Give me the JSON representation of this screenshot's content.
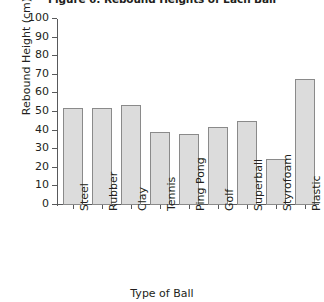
{
  "chart_data": {
    "type": "bar",
    "title": "Figure 6: Rebound Heights of Each Ball",
    "xlabel": "Type of Ball",
    "ylabel": "Rebound Height (cm)",
    "categories": [
      "Steel",
      "Rubber",
      "Clay",
      "Tennis",
      "Ping Pong",
      "Golf",
      "Superball",
      "Styrofoam",
      "Plastic"
    ],
    "values": [
      52,
      52,
      54,
      39,
      38,
      42,
      45,
      25,
      68
    ],
    "ylim": [
      0,
      100
    ],
    "ytick_step": 10,
    "yticks": [
      0,
      10,
      20,
      30,
      40,
      50,
      60,
      70,
      80,
      90,
      100
    ],
    "ytick_labels": [
      "0",
      "10",
      "20",
      "30",
      "40",
      "50",
      "60",
      "70",
      "80",
      "90",
      "100"
    ],
    "grid": false,
    "legend": null,
    "bar_fill_color": "#dcdcdc",
    "bar_border_color": "#8a8a8a",
    "axis_color": "#58595b",
    "text_color": "#231f20",
    "background_color": "#ffffff"
  }
}
